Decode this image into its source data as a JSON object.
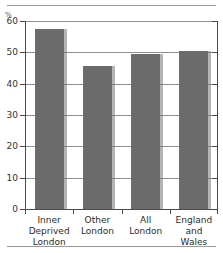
{
  "chart_data": {
    "type": "bar",
    "title": "",
    "subtitle": "",
    "xlabel": "",
    "ylabel": "%",
    "unit_symbol": "%",
    "categories": [
      "Inner\nDeprived\nLondon",
      "Other\nLondon",
      "All\nLondon",
      "England\nand\nWales"
    ],
    "values": [
      57.5,
      45.5,
      49.5,
      50.5
    ],
    "ylim": [
      0,
      60
    ],
    "yticks": [
      0,
      10,
      20,
      30,
      40,
      50,
      60
    ],
    "ytick_labels": [
      "0",
      "10",
      "20",
      "30",
      "40",
      "50",
      "60"
    ],
    "grid": true,
    "legend": false,
    "legend_position": "none",
    "series": [
      {
        "name": "",
        "values": [
          57.5,
          45.5,
          49.5,
          50.5
        ]
      }
    ],
    "colors": {
      "bar_fill": "#6b6b6b",
      "bar_shadow": "#9a9a9a",
      "gridline": "#8e8e8e",
      "axis": "#4a4a4a",
      "text": "#2b2b2b",
      "background": "#ffffff",
      "frame_rule": "#9a9a9a"
    }
  }
}
